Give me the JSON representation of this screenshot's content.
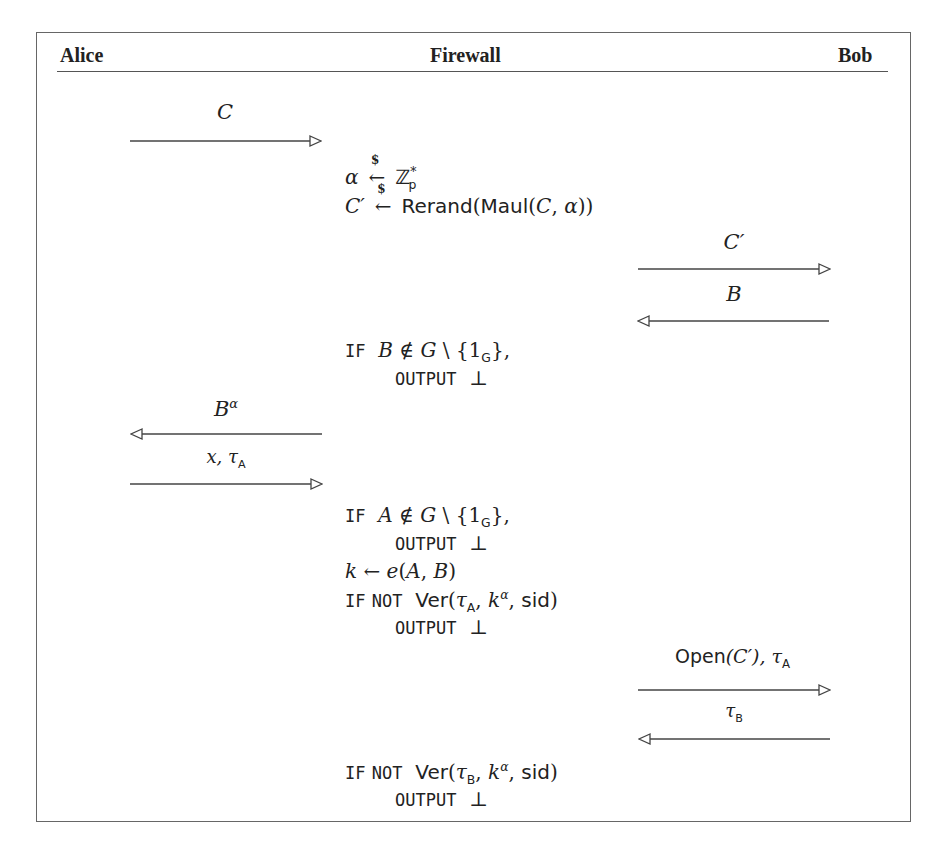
{
  "header": {
    "parties": [
      "Alice",
      "Firewall",
      "Bob"
    ]
  },
  "messages": [
    {
      "id": "m1",
      "label": "C",
      "direction": "right",
      "between": "Alice-Firewall"
    },
    {
      "id": "m2",
      "label": "C′",
      "direction": "right",
      "between": "Firewall-Bob"
    },
    {
      "id": "m3",
      "label": "B",
      "direction": "left",
      "between": "Firewall-Bob"
    },
    {
      "id": "m4",
      "label": "B^α",
      "direction": "left",
      "between": "Alice-Firewall"
    },
    {
      "id": "m5",
      "label": "x, τ_A",
      "direction": "right",
      "between": "Alice-Firewall"
    },
    {
      "id": "m6",
      "label": "Open(C′), τ_A",
      "direction": "right",
      "between": "Firewall-Bob"
    },
    {
      "id": "m7",
      "label": "τ_B",
      "direction": "left",
      "between": "Firewall-Bob"
    }
  ],
  "firewall": {
    "step1": [
      "α ←$ Z*_p",
      "C′ ←$ Rerand(Maul(C, α))"
    ],
    "step2": [
      "IF B ∉ G \\ {1_G},",
      "OUTPUT ⊥"
    ],
    "step3": [
      "IF A ∉ G \\ {1_G},",
      "OUTPUT ⊥",
      "k ← e(A, B)",
      "IF NOT Ver(τ_A, k^α, sid)",
      "OUTPUT ⊥"
    ],
    "step4": [
      "IF NOT Ver(τ_B, k^α, sid)",
      "OUTPUT ⊥"
    ]
  },
  "text": {
    "if": "IF",
    "not": "NOT",
    "output": "OUTPUT",
    "bottom": "⊥",
    "alpha": "α",
    "sample_sym": "$",
    "larrow": "←",
    "Zp": "ℤ",
    "p": "p",
    "star": "*",
    "Cprime": "C′",
    "rerand": "Rerand",
    "maul": "Maul",
    "C": "C",
    "B": "B",
    "A": "A",
    "G": "G",
    "notin": "∉",
    "setminus": "\\",
    "one": "1",
    "k": "k",
    "e": "e",
    "ver": "Ver",
    "tau": "τ",
    "subA": "A",
    "subB": "B",
    "sid": "sid",
    "x": "x",
    "open": "Open"
  }
}
